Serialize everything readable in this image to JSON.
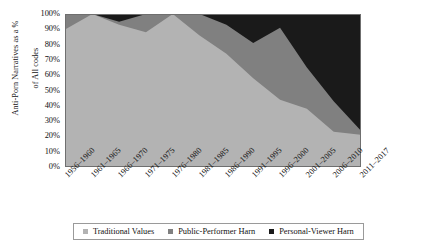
{
  "chart_data": {
    "type": "area",
    "title": "",
    "subtitle": "",
    "xlabel": "",
    "ylabel": "Anti-Porn Narratives as a % of All codes",
    "stacked": true,
    "normalized_percent": true,
    "grid": false,
    "legend_position": "bottom",
    "ylim": [
      0,
      100
    ],
    "ytick_labels": [
      "100%",
      "90%",
      "80%",
      "70%",
      "60%",
      "50%",
      "40%",
      "30%",
      "20%",
      "10%",
      "0%"
    ],
    "ytick_values": [
      100,
      90,
      80,
      70,
      60,
      50,
      40,
      30,
      20,
      10,
      0
    ],
    "categories": [
      "1956–1960",
      "1961–1965",
      "1966–1970",
      "1971–1975",
      "1976–1980",
      "1981–1985",
      "1986–1990",
      "1991–1995",
      "1996–2000",
      "2001–2005",
      "2006–2010",
      "2011–2017"
    ],
    "series": [
      {
        "name": "Traditional Values",
        "color": "#b3b3b3",
        "values": [
          90,
          100,
          93,
          88,
          100,
          86,
          74,
          58,
          44,
          38,
          23,
          21
        ]
      },
      {
        "name": "Public-Performer Harn",
        "color": "#808080",
        "values": [
          10,
          0,
          2,
          12,
          0,
          14,
          19,
          23,
          47,
          27,
          20,
          3
        ]
      },
      {
        "name": "Personal-Viewer Harn",
        "color": "#1a1a1a",
        "values": [
          0,
          0,
          5,
          0,
          0,
          0,
          7,
          19,
          9,
          35,
          57,
          76
        ]
      }
    ],
    "cumulative_upper_bounds": {
      "traditional_values": [
        90,
        100,
        93,
        88,
        100,
        86,
        74,
        58,
        44,
        38,
        23,
        21
      ],
      "public_performer_harn": [
        100,
        100,
        95,
        100,
        100,
        100,
        93,
        81,
        91,
        65,
        43,
        24
      ],
      "personal_viewer_harn": [
        100,
        100,
        100,
        100,
        100,
        100,
        100,
        100,
        100,
        100,
        100,
        100
      ]
    }
  },
  "legend": {
    "items": [
      {
        "label": "Traditional Values",
        "color": "#b3b3b3"
      },
      {
        "label": "Public-Performer Harn",
        "color": "#808080"
      },
      {
        "label": "Personal-Viewer Harn",
        "color": "#1a1a1a"
      }
    ]
  },
  "axes": {
    "y_title": "Anti-Porn Narratives as a %\nof All codes",
    "y_title_line1": "Anti-Porn Narratives as a %",
    "y_title_line2": "of All codes"
  },
  "colors": {
    "series_light": "#b3b3b3",
    "series_medium": "#808080",
    "series_dark": "#1a1a1a",
    "axis": "#595959",
    "background": "#ffffff"
  }
}
